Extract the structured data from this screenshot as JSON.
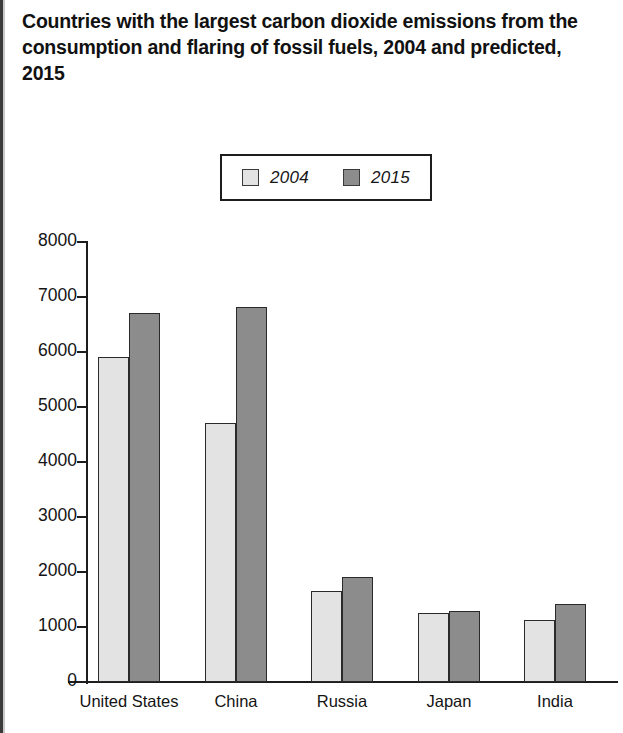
{
  "chart_data": {
    "type": "bar",
    "title": "Countries with the largest carbon dioxide emissions from the consumption and flaring of fossil fuels, 2004 and predicted, 2015",
    "xlabel": "",
    "ylabel": "",
    "categories": [
      "United States",
      "China",
      "Russia",
      "Japan",
      "India"
    ],
    "series": [
      {
        "name": "2004",
        "color": "#e3e3e3",
        "values": [
          5900,
          4700,
          1650,
          1250,
          1120
        ]
      },
      {
        "name": "2015",
        "color": "#8c8c8c",
        "values": [
          6700,
          6800,
          1900,
          1280,
          1420
        ]
      }
    ],
    "ylim": [
      0,
      8000
    ],
    "y_ticks": [
      "0",
      "1000",
      "2000",
      "3000",
      "4000",
      "5000",
      "6000",
      "7000",
      "8000"
    ],
    "y_tick_values": [
      0,
      1000,
      2000,
      3000,
      4000,
      5000,
      6000,
      7000,
      8000
    ],
    "grid": false,
    "legend_position": "top-center",
    "legend_entries": [
      "2004",
      "2015"
    ]
  },
  "legend": {
    "items": [
      {
        "label": "2004",
        "swatch_color": "#e3e3e3"
      },
      {
        "label": "2015",
        "swatch_color": "#8c8c8c"
      }
    ]
  },
  "axes": {
    "y_tick_labels": [
      "8000",
      "7000",
      "6000",
      "5000",
      "4000",
      "3000",
      "2000",
      "1000",
      "0"
    ],
    "x_tick_labels": [
      "United States",
      "China",
      "Russia",
      "Japan",
      "India"
    ]
  },
  "colors": {
    "series_2004": "#e3e3e3",
    "series_2015": "#8c8c8c",
    "axis": "#1d1d1d",
    "bar_outline": "#2a2a2a",
    "text": "#111111"
  }
}
